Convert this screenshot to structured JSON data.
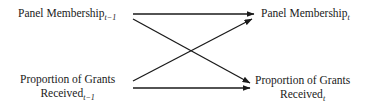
{
  "diagram": {
    "type": "cross-lagged path diagram",
    "nodes": [
      {
        "id": "pm_prev",
        "label": "Panel Membership",
        "subscript": "t−1"
      },
      {
        "id": "pg_prev",
        "line1": "Proportion of Grants",
        "label": "Received",
        "subscript": "t−1"
      },
      {
        "id": "pm_curr",
        "label": "Panel Membership",
        "subscript": "t"
      },
      {
        "id": "pg_curr",
        "line1": "Proportion of Grants",
        "label": "Received",
        "subscript": "t"
      }
    ],
    "edges": [
      {
        "from": "pm_prev",
        "to": "pm_curr"
      },
      {
        "from": "pm_prev",
        "to": "pg_curr"
      },
      {
        "from": "pg_prev",
        "to": "pm_curr"
      },
      {
        "from": "pg_prev",
        "to": "pg_curr"
      }
    ],
    "colors": {
      "line": "#1a1a1a",
      "text": "#1a1a1a",
      "background": "#ffffff"
    }
  }
}
